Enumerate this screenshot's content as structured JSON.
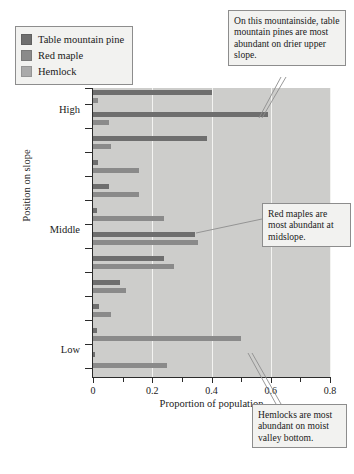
{
  "chart_data": {
    "type": "bar",
    "orientation": "horizontal",
    "title": "",
    "xlabel": "Proportion of population",
    "ylabel": "Position on slope",
    "xlim": [
      0,
      0.8
    ],
    "xticks": [
      0,
      0.2,
      0.4,
      0.6,
      0.8
    ],
    "xticklabels": [
      "0",
      "0.2",
      "0.4",
      "0.6",
      "0.8"
    ],
    "yticklabels": [
      "High",
      "Middle",
      "Low"
    ],
    "grid": "vertical-white-gridlines",
    "legend_position": "above-plot-left",
    "categories": [
      "site-1-top",
      "site-2",
      "site-3",
      "site-4",
      "site-5-middle",
      "site-6",
      "site-7",
      "site-8",
      "site-9-bottom"
    ],
    "series": [
      {
        "name": "Table mountain pine",
        "color": "#6e6e6e",
        "values": [
          0.4,
          0.59,
          0.385,
          0.018,
          0.055,
          0.012,
          0.24,
          0.345,
          0.005
        ]
      },
      {
        "name": "Red maple",
        "color": "#8a8a8a",
        "values": [
          0.018,
          0.055,
          0.06,
          0.155,
          0.155,
          0.275,
          0.355,
          0.09,
          0.02
        ]
      },
      {
        "name": "Hemlock",
        "color": "#aaaaaa",
        "values": [
          0.0,
          0.0,
          0.0,
          0.0,
          0.0,
          0.0,
          0.0,
          0.11,
          0.5
        ]
      }
    ],
    "bottom_series_note": "lowest group hemlock extends to 0.50; final bar 0.25",
    "extra_bars": [
      {
        "label": "lowest-hemlock",
        "value": 0.5
      },
      {
        "label": "lowest-final",
        "value": 0.25
      }
    ],
    "annotations": [
      "On this mountainside, table mountain pines are most abundant on drier upper slope.",
      "Red maples are most abundant at midslope.",
      "Hemlocks are most abundant on moist valley bottom."
    ]
  },
  "legend": {
    "items": [
      {
        "label": "Table mountain pine",
        "color": "#6e6e6e"
      },
      {
        "label": "Red maple",
        "color": "#8a8a8a"
      },
      {
        "label": "Hemlock",
        "color": "#aaaaaa"
      }
    ]
  },
  "axes": {
    "x_title": "Proportion of population",
    "y_title": "Position on slope",
    "x_ticklabels": [
      "0",
      "0.2",
      "0.4",
      "0.6",
      "0.8"
    ],
    "y_ticklabels": [
      "High",
      "Middle",
      "Low"
    ]
  },
  "callouts": {
    "one": "On this mountainside, table mountain pines are most abundant on drier upper slope.",
    "two": "Red maples are most abundant at midslope.",
    "three": "Hemlocks are most abundant on moist valley bottom."
  },
  "bars": [
    {
      "value": 0.4,
      "species": "Table mountain pine",
      "color": "#6e6e6e",
      "top": 2
    },
    {
      "value": 0.018,
      "species": "Red maple",
      "color": "#8a8a8a",
      "top": 10
    },
    {
      "value": 0.59,
      "species": "Table mountain pine",
      "color": "#6e6e6e",
      "top": 24
    },
    {
      "value": 0.055,
      "species": "Red maple",
      "color": "#8a8a8a",
      "top": 32
    },
    {
      "value": 0.385,
      "species": "Table mountain pine",
      "color": "#6e6e6e",
      "top": 48
    },
    {
      "value": 0.06,
      "species": "Red maple",
      "color": "#8a8a8a",
      "top": 56
    },
    {
      "value": 0.018,
      "species": "Table mountain pine",
      "color": "#6e6e6e",
      "top": 72
    },
    {
      "value": 0.155,
      "species": "Red maple",
      "color": "#8a8a8a",
      "top": 80
    },
    {
      "value": 0.055,
      "species": "Table mountain pine",
      "color": "#6e6e6e",
      "top": 96
    },
    {
      "value": 0.155,
      "species": "Red maple",
      "color": "#8a8a8a",
      "top": 104
    },
    {
      "value": 0.012,
      "species": "Table mountain pine",
      "color": "#6e6e6e",
      "top": 120
    },
    {
      "value": 0.24,
      "species": "Red maple",
      "color": "#8a8a8a",
      "top": 128
    },
    {
      "value": 0.345,
      "species": "Table mountain pine",
      "color": "#6e6e6e",
      "top": 144
    },
    {
      "value": 0.355,
      "species": "Red maple",
      "color": "#8a8a8a",
      "top": 152
    },
    {
      "value": 0.24,
      "species": "Table mountain pine",
      "color": "#6e6e6e",
      "top": 168
    },
    {
      "value": 0.275,
      "species": "Red maple",
      "color": "#8a8a8a",
      "top": 176
    },
    {
      "value": 0.09,
      "species": "Table mountain pine",
      "color": "#6e6e6e",
      "top": 192
    },
    {
      "value": 0.11,
      "species": "Red maple",
      "color": "#8a8a8a",
      "top": 200
    },
    {
      "value": 0.02,
      "species": "Table mountain pine",
      "color": "#6e6e6e",
      "top": 216
    },
    {
      "value": 0.06,
      "species": "Red maple",
      "color": "#8a8a8a",
      "top": 224
    },
    {
      "value": 0.015,
      "species": "Table mountain pine",
      "color": "#6e6e6e",
      "top": 240
    },
    {
      "value": 0.5,
      "species": "Hemlock",
      "color": "#8a8a8a",
      "top": 248
    },
    {
      "value": 0.005,
      "species": "Table mountain pine",
      "color": "#6e6e6e",
      "top": 264
    },
    {
      "value": 0.25,
      "species": "Hemlock",
      "color": "#8a8a8a",
      "top": 275
    }
  ],
  "ytick_positions": [
    0,
    16,
    40,
    64,
    88,
    112,
    136,
    160,
    184,
    208,
    232,
    256,
    280
  ],
  "ylabel_positions": [
    {
      "label": "High",
      "top": 22
    },
    {
      "label": "Middle",
      "top": 142
    },
    {
      "label": "Low",
      "top": 262
    }
  ]
}
